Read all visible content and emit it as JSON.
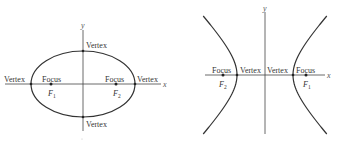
{
  "ellipse": {
    "axis_x_label": "x",
    "axis_y_label": "y",
    "vertex_labels": {
      "top": "Vertex",
      "bottom": "Vertex",
      "left": "Vertex",
      "right": "Vertex"
    },
    "focus_labels": {
      "left": "Focus",
      "right": "Focus"
    },
    "foci": [
      {
        "name": "F",
        "subscript": "1"
      },
      {
        "name": "F",
        "subscript": "2"
      }
    ]
  },
  "hyperbola": {
    "axis_x_label": "x",
    "axis_y_label": "y",
    "vertex_labels": {
      "left": "Vertex",
      "right": "Vertex"
    },
    "focus_labels": {
      "left": "Focus",
      "right": "Focus"
    },
    "foci": [
      {
        "name": "F",
        "subscript": "2"
      },
      {
        "name": "F",
        "subscript": "1"
      }
    ]
  },
  "colors": {
    "line": "#333333",
    "background": "#ffffff"
  }
}
